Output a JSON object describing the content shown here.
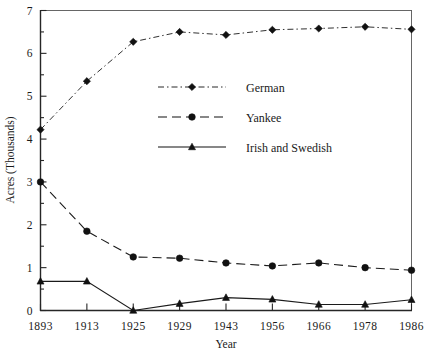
{
  "chart_data": {
    "type": "line",
    "title": "",
    "xlabel": "Year",
    "ylabel": "Acres (Thousands)",
    "categories": [
      "1893",
      "1913",
      "1925",
      "1929",
      "1943",
      "1956",
      "1966",
      "1978",
      "1986"
    ],
    "ylim": [
      0,
      7
    ],
    "yticks": [
      0,
      1,
      2,
      3,
      4,
      5,
      6,
      7
    ],
    "ytick_labels": [
      "0",
      "1",
      "2",
      "3",
      "4",
      "5",
      "6",
      "7"
    ],
    "grid": false,
    "legend_position": "center",
    "series": [
      {
        "name": "German",
        "values": [
          4.22,
          5.35,
          6.27,
          6.5,
          6.43,
          6.55,
          6.58,
          6.62,
          6.56
        ],
        "line_style": "dashdot",
        "marker": "diamond",
        "color": "#111111"
      },
      {
        "name": "Yankee",
        "values": [
          3.0,
          1.85,
          1.25,
          1.22,
          1.11,
          1.04,
          1.11,
          1.0,
          0.94
        ],
        "line_style": "dashed",
        "marker": "circle",
        "color": "#111111"
      },
      {
        "name": "Irish and Swedish",
        "values": [
          0.68,
          0.68,
          0.0,
          0.16,
          0.3,
          0.26,
          0.14,
          0.14,
          0.25
        ],
        "line_style": "solid",
        "marker": "triangle",
        "color": "#111111"
      }
    ]
  },
  "legend": {
    "entries": [
      {
        "label": "German"
      },
      {
        "label": "Yankee"
      },
      {
        "label": "Irish and Swedish"
      }
    ]
  },
  "axes": {
    "x_title": "Year",
    "y_title": "Acres (Thousands)"
  }
}
